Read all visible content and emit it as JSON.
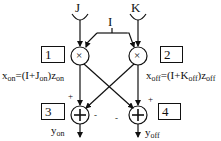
{
  "diagram": {
    "inputs": {
      "j": "J",
      "k": "K",
      "i": "I"
    },
    "nodes": {
      "mult_left": "×",
      "mult_right": "×",
      "sum_left": "+",
      "sum_right": "+"
    },
    "boxes": {
      "box1": "1",
      "box2": "2",
      "box3": "3",
      "box4": "4"
    },
    "equations": {
      "left_prefix": "x",
      "left_prefix_sub": "on",
      "left_mid": "=(I+J",
      "left_mid_sub": "on",
      "left_end": ")z",
      "left_end_sub": "on",
      "right_prefix": "x",
      "right_prefix_sub": "off",
      "right_mid": "=(I+K",
      "right_mid_sub": "off",
      "right_end": ")z",
      "right_end_sub": "off"
    },
    "signs": {
      "left_plus": "+",
      "left_minus": "-",
      "right_minus": "-",
      "right_plus": "+"
    },
    "outputs": {
      "y_on": "y",
      "y_on_sub": "on",
      "y_off": "y",
      "y_off_sub": "off"
    },
    "colors": {
      "stroke": "#111111",
      "background": "#ffffff"
    }
  }
}
